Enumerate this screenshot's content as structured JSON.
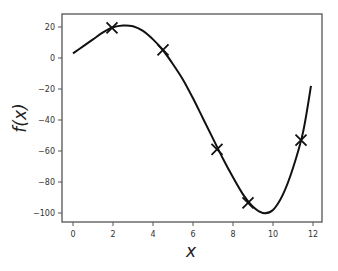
{
  "chart_data": {
    "type": "line",
    "title": "",
    "xlabel": "x",
    "ylabel": "f(x)",
    "xlim": [
      -0.6,
      12.45
    ],
    "ylim": [
      -105,
      28
    ],
    "x_ticks": [
      0,
      2,
      4,
      6,
      8,
      10,
      12
    ],
    "y_ticks": [
      20,
      0,
      -20,
      -40,
      -60,
      -80,
      -100
    ],
    "grid": false,
    "legend": null,
    "series": [
      {
        "name": "f(x) curve",
        "style": "line",
        "color": "#111111",
        "x": [
          0,
          0.5,
          1,
          1.5,
          2,
          2.5,
          3,
          3.5,
          4,
          4.5,
          5,
          5.5,
          6,
          6.5,
          7,
          7.5,
          8,
          8.5,
          9,
          9.5,
          10,
          10.5,
          11,
          11.5,
          11.9
        ],
        "y": [
          3,
          7.5,
          12,
          16.5,
          19.8,
          21,
          20.5,
          17.5,
          12,
          5,
          -4,
          -14,
          -26,
          -39,
          -52,
          -65,
          -77,
          -88,
          -96,
          -100,
          -98,
          -88,
          -71,
          -48,
          -18
        ]
      },
      {
        "name": "observations",
        "style": "marker-x",
        "color": "#111111",
        "x": [
          1.95,
          4.5,
          7.2,
          8.75,
          11.4
        ],
        "y": [
          19.4,
          5.2,
          -59,
          -93.5,
          -53
        ]
      }
    ]
  }
}
